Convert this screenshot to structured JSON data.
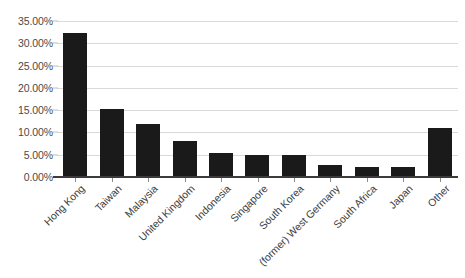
{
  "chart_data": {
    "type": "bar",
    "title": "",
    "subtitle": "",
    "xlabel": "",
    "ylabel": "",
    "categories": [
      "Hong Kong",
      "Taiwan",
      "Malaysia",
      "United Kingdom",
      "Indonesia",
      "Singapore",
      "South Korea",
      "(former) West Germany",
      "South Africa",
      "Japan",
      "Other"
    ],
    "values": [
      32.3,
      15.3,
      12.0,
      8.0,
      5.5,
      5.0,
      4.9,
      2.8,
      2.3,
      2.2,
      10.9
    ],
    "value_unit": "percent",
    "ylim": [
      0,
      35
    ],
    "ytick_values": [
      0,
      5,
      10,
      15,
      20,
      25,
      30,
      35
    ],
    "ytick_labels": [
      "0.00%",
      "5.00%",
      "10.00%",
      "15.00%",
      "20.00%",
      "25.00%",
      "30.00%",
      "35.00%"
    ],
    "grid": true,
    "legend": false,
    "legend_position": "none",
    "bar_color": "#1a1a1a",
    "gridline_color": "#d9d9d9",
    "axis_color": "#3b3b3b",
    "label_color": "#4a4a4a",
    "xlabel_rotation_degrees": -45
  }
}
